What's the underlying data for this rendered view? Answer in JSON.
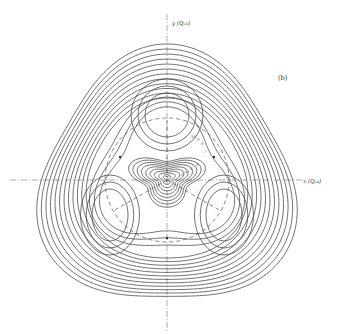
{
  "figure": {
    "panel_label": "(b)",
    "y_axis_label": "y (Q₂₃)",
    "x_axis_label": "x (Q₂₄)",
    "contour_labels": [
      "-10",
      "-9",
      "-8",
      "-7",
      "-6",
      "-5",
      "-4",
      "-3"
    ]
  },
  "geometry": {
    "origin": [
      167,
      180
    ],
    "trough_radius": 62,
    "minima": [
      [
        167,
        115
      ],
      [
        110,
        215
      ],
      [
        224,
        215
      ]
    ],
    "saddles": [
      [
        214,
        157
      ],
      [
        120,
        157
      ],
      [
        167,
        238
      ]
    ]
  },
  "colors": {
    "line": "#444444",
    "axis": "#777777",
    "background": "#ffffff"
  }
}
